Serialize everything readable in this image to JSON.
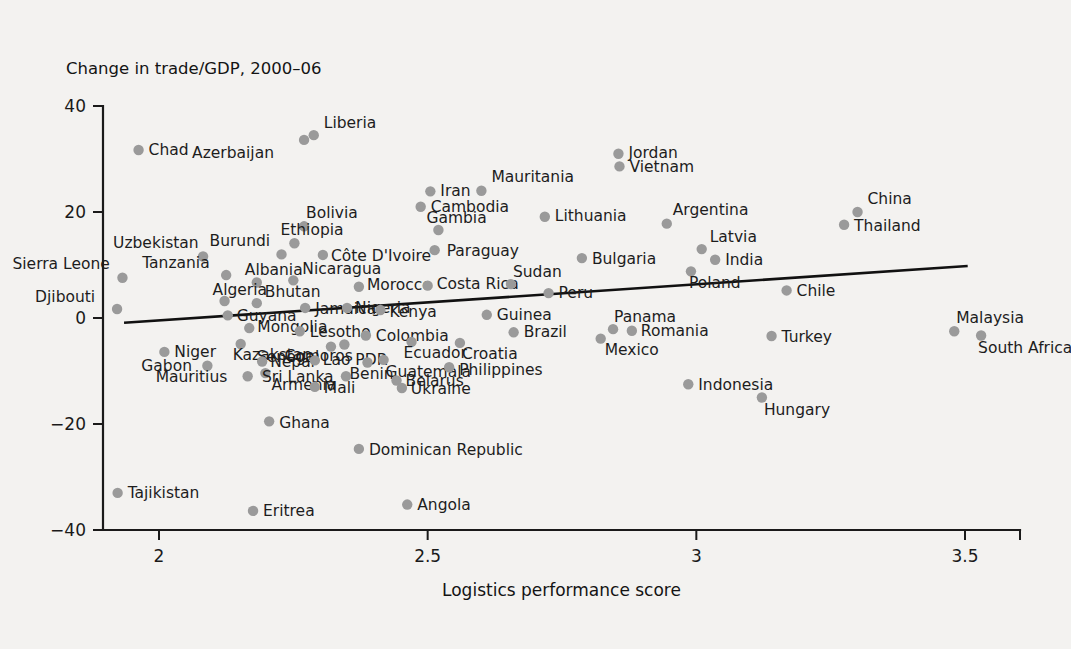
{
  "chart_data": {
    "type": "scatter",
    "title": "Change in trade/GDP, 2000–06",
    "xlabel": "Logistics performance score",
    "ylabel": "Change in trade/GDP, 2000–06",
    "xlim": [
      1.88,
      3.58
    ],
    "ylim": [
      -40,
      40
    ],
    "xticks": [
      "2",
      "2.5",
      "3",
      "3.5"
    ],
    "xtick_values": [
      2,
      2.5,
      3,
      3.5
    ],
    "yticks": [
      "40",
      "20",
      "0",
      "−20",
      "−40"
    ],
    "ytick_values": [
      40,
      20,
      0,
      -20,
      -40
    ],
    "grid": false,
    "legend": "none",
    "point_color": "#9a9a9a",
    "line_color": "#111111",
    "background_color": "#f3f2f0",
    "trend_line": {
      "x_start": 1.935,
      "y_start": -0.9,
      "x_end": 3.505,
      "y_end": 9.8
    },
    "points": [
      {
        "name": "Chad",
        "x": 1.962,
        "y": 31.7,
        "label_dx": 10,
        "label_dy": 1
      },
      {
        "name": "Liberia",
        "x": 2.288,
        "y": 34.5,
        "label_dx": 10,
        "label_dy": -12
      },
      {
        "name": "Azerbaijan",
        "x": 2.27,
        "y": 33.6,
        "label_dx": -112,
        "label_dy": 14
      },
      {
        "name": "Jordan",
        "x": 2.855,
        "y": 31.0,
        "label_dx": 10,
        "label_dy": 0
      },
      {
        "name": "Vietnam",
        "x": 2.857,
        "y": 28.6,
        "label_dx": 10,
        "label_dy": 1
      },
      {
        "name": "Iran",
        "x": 2.505,
        "y": 23.9,
        "label_dx": 10,
        "label_dy": 0
      },
      {
        "name": "Mauritania",
        "x": 2.6,
        "y": 24.0,
        "label_dx": 10,
        "label_dy": -13
      },
      {
        "name": "Cambodia",
        "x": 2.487,
        "y": 21.0,
        "label_dx": 10,
        "label_dy": 1
      },
      {
        "name": "China",
        "x": 3.3,
        "y": 20.0,
        "label_dx": 10,
        "label_dy": -13
      },
      {
        "name": "Thailand",
        "x": 3.275,
        "y": 17.6,
        "label_dx": 10,
        "label_dy": 2
      },
      {
        "name": "Bolivia",
        "x": 2.27,
        "y": 17.3,
        "label_dx": 2,
        "label_dy": -13
      },
      {
        "name": "Gambia",
        "x": 2.52,
        "y": 16.6,
        "label_dx": -12,
        "label_dy": -12
      },
      {
        "name": "Lithuania",
        "x": 2.718,
        "y": 19.1,
        "label_dx": 10,
        "label_dy": 0
      },
      {
        "name": "Argentina",
        "x": 2.945,
        "y": 17.8,
        "label_dx": 6,
        "label_dy": -13
      },
      {
        "name": "Ethiopia",
        "x": 2.252,
        "y": 14.1,
        "label_dx": -14,
        "label_dy": -13
      },
      {
        "name": "Uzbekistan",
        "x": 2.082,
        "y": 11.6,
        "label_dx": -90,
        "label_dy": -13
      },
      {
        "name": "Burundi",
        "x": 2.228,
        "y": 12.0,
        "label_dx": -72,
        "label_dy": -13
      },
      {
        "name": "Côte D'Ivoire",
        "x": 2.305,
        "y": 11.9,
        "label_dx": 8,
        "label_dy": 2
      },
      {
        "name": "Paraguay",
        "x": 2.513,
        "y": 12.8,
        "label_dx": 12,
        "label_dy": 1
      },
      {
        "name": "Latvia",
        "x": 3.01,
        "y": 13.0,
        "label_dx": 8,
        "label_dy": -12
      },
      {
        "name": "India",
        "x": 3.035,
        "y": 11.0,
        "label_dx": 10,
        "label_dy": 1
      },
      {
        "name": "Bulgaria",
        "x": 2.787,
        "y": 11.3,
        "label_dx": 10,
        "label_dy": 1
      },
      {
        "name": "Sierra Leone",
        "x": 1.932,
        "y": 7.6,
        "label_dx": -110,
        "label_dy": -13
      },
      {
        "name": "Tanzania",
        "x": 2.125,
        "y": 8.1,
        "label_dx": -84,
        "label_dy": -12
      },
      {
        "name": "Albania",
        "x": 2.182,
        "y": 6.7,
        "label_dx": -12,
        "label_dy": -12
      },
      {
        "name": "Nicaragua",
        "x": 2.25,
        "y": 7.1,
        "label_dx": 9,
        "label_dy": -11
      },
      {
        "name": "Morocco",
        "x": 2.372,
        "y": 5.9,
        "label_dx": 8,
        "label_dy": -1
      },
      {
        "name": "Costa Rica",
        "x": 2.5,
        "y": 6.1,
        "label_dx": 9,
        "label_dy": -1
      },
      {
        "name": "Sudan",
        "x": 2.655,
        "y": 6.4,
        "label_dx": 2,
        "label_dy": -12
      },
      {
        "name": "Peru",
        "x": 2.725,
        "y": 4.7,
        "label_dx": 10,
        "label_dy": 0
      },
      {
        "name": "Poland",
        "x": 2.99,
        "y": 8.8,
        "label_dx": -2,
        "label_dy": 12
      },
      {
        "name": "Djibouti",
        "x": 1.922,
        "y": 1.7,
        "label_dx": -82,
        "label_dy": -11
      },
      {
        "name": "Algeria",
        "x": 2.122,
        "y": 3.2,
        "label_dx": -12,
        "label_dy": -11
      },
      {
        "name": "Bhutan",
        "x": 2.182,
        "y": 2.8,
        "label_dx": 8,
        "label_dy": -11
      },
      {
        "name": "Jamaica",
        "x": 2.272,
        "y": 1.9,
        "label_dx": 10,
        "label_dy": 2
      },
      {
        "name": "Nigeria",
        "x": 2.35,
        "y": 1.9,
        "label_dx": 8,
        "label_dy": 1
      },
      {
        "name": "Kenya",
        "x": 2.412,
        "y": 1.5,
        "label_dx": 9,
        "label_dy": 2
      },
      {
        "name": "Guyana",
        "x": 2.128,
        "y": 0.5,
        "label_dx": 9,
        "label_dy": 1
      },
      {
        "name": "Guinea",
        "x": 2.61,
        "y": 0.6,
        "label_dx": 10,
        "label_dy": 1
      },
      {
        "name": "Chile",
        "x": 3.168,
        "y": 5.2,
        "label_dx": 10,
        "label_dy": 1
      },
      {
        "name": "Mongolia",
        "x": 2.168,
        "y": -1.9,
        "label_dx": 8,
        "label_dy": -1
      },
      {
        "name": "Lesotho",
        "x": 2.262,
        "y": -2.5,
        "label_dx": 10,
        "label_dy": 1
      },
      {
        "name": "Colombia",
        "x": 2.385,
        "y": -3.3,
        "label_dx": 10,
        "label_dy": 1
      },
      {
        "name": "Brazil",
        "x": 2.66,
        "y": -2.7,
        "label_dx": 10,
        "label_dy": 0
      },
      {
        "name": "Panama",
        "x": 2.845,
        "y": -2.1,
        "label_dx": 1,
        "label_dy": -12
      },
      {
        "name": "Romania",
        "x": 2.88,
        "y": -2.4,
        "label_dx": 9,
        "label_dy": 1
      },
      {
        "name": "Mexico",
        "x": 2.822,
        "y": -3.9,
        "label_dx": 4,
        "label_dy": 12
      },
      {
        "name": "Turkey",
        "x": 3.14,
        "y": -3.4,
        "label_dx": 10,
        "label_dy": 1
      },
      {
        "name": "Malaysia",
        "x": 3.48,
        "y": -2.5,
        "label_dx": 2,
        "label_dy": -13
      },
      {
        "name": "South Africa",
        "x": 3.53,
        "y": -3.3,
        "label_dx": -3,
        "label_dy": 13
      },
      {
        "name": "Niger",
        "x": 2.01,
        "y": -6.4,
        "label_dx": 10,
        "label_dy": 1
      },
      {
        "name": "Kazakstan",
        "x": 2.152,
        "y": -4.9,
        "label_dx": -8,
        "label_dy": 12
      },
      {
        "name": "Senegal",
        "x": 2.32,
        "y": -5.4,
        "label_dx": -74,
        "label_dy": 11
      },
      {
        "name": "Comoros",
        "x": 2.345,
        "y": -5.0,
        "label_dx": -60,
        "label_dy": 12
      },
      {
        "name": "Ecuador",
        "x": 2.47,
        "y": -4.5,
        "label_dx": -8,
        "label_dy": 12
      },
      {
        "name": "Croatia",
        "x": 2.56,
        "y": -4.7,
        "label_dx": 2,
        "label_dy": 12
      },
      {
        "name": "Gabon",
        "x": 2.09,
        "y": -9.0,
        "label_dx": -66,
        "label_dy": 1
      },
      {
        "name": "Nepal",
        "x": 2.192,
        "y": -8.2,
        "label_dx": 8,
        "label_dy": 1
      },
      {
        "name": "Lao PDR",
        "x": 2.29,
        "y": -8.0,
        "label_dx": 8,
        "label_dy": 0
      },
      {
        "name": "Benin",
        "x": 2.388,
        "y": -8.4,
        "label_dx": -18,
        "label_dy": 12
      },
      {
        "name": "Guatemala",
        "x": 2.418,
        "y": -7.9,
        "label_dx": 2,
        "label_dy": 13
      },
      {
        "name": "Philippines",
        "x": 2.54,
        "y": -9.3,
        "label_dx": 10,
        "label_dy": 3
      },
      {
        "name": "Mauritius",
        "x": 2.165,
        "y": -11.0,
        "label_dx": -92,
        "label_dy": 1
      },
      {
        "name": "Armenia",
        "x": 2.198,
        "y": -10.4,
        "label_dx": 6,
        "label_dy": 12
      },
      {
        "name": "Sri Lanka",
        "x": 2.348,
        "y": -11.0,
        "label_dx": -84,
        "label_dy": 1
      },
      {
        "name": "Belarus",
        "x": 2.442,
        "y": -11.8,
        "label_dx": 9,
        "label_dy": 1
      },
      {
        "name": "Ukraine",
        "x": 2.452,
        "y": -13.2,
        "label_dx": 9,
        "label_dy": 2
      },
      {
        "name": "Mali",
        "x": 2.29,
        "y": -13.0,
        "label_dx": 9,
        "label_dy": 2
      },
      {
        "name": "Indonesia",
        "x": 2.985,
        "y": -12.5,
        "label_dx": 10,
        "label_dy": 1
      },
      {
        "name": "Hungary",
        "x": 3.122,
        "y": -15.0,
        "label_dx": 2,
        "label_dy": 13
      },
      {
        "name": "Ghana",
        "x": 2.205,
        "y": -19.5,
        "label_dx": 10,
        "label_dy": 2
      },
      {
        "name": "Dominican Republic",
        "x": 2.372,
        "y": -24.7,
        "label_dx": 10,
        "label_dy": 2
      },
      {
        "name": "Tajikistan",
        "x": 1.923,
        "y": -33.0,
        "label_dx": 10,
        "label_dy": 1
      },
      {
        "name": "Eritrea",
        "x": 2.175,
        "y": -36.4,
        "label_dx": 10,
        "label_dy": 1
      },
      {
        "name": "Angola",
        "x": 2.462,
        "y": -35.2,
        "label_dx": 10,
        "label_dy": 1
      }
    ]
  }
}
